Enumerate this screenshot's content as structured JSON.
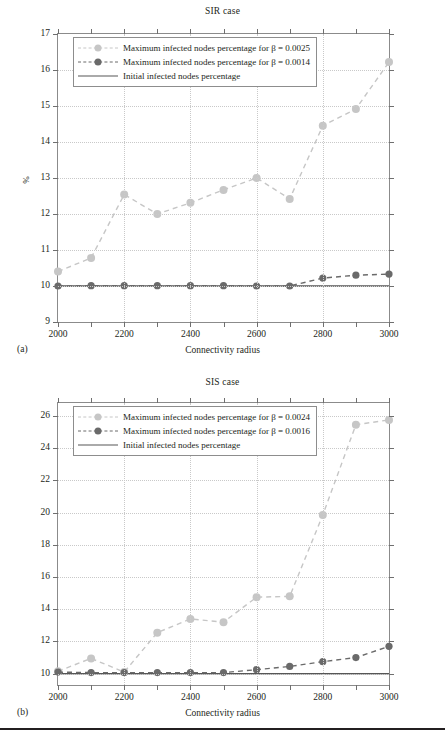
{
  "figure": {
    "panels": [
      {
        "caption": "(a)",
        "title": "SIR case",
        "xlabel": "Connectivity radius",
        "ylabel": "%"
      },
      {
        "caption": "(b)",
        "title": "SIS case",
        "xlabel": "Connectivity radius",
        "ylabel": "%"
      }
    ]
  },
  "colors": {
    "light_series": "#c6c6c6",
    "dark_series": "#6a6a6a",
    "baseline": "#565656",
    "frame": "#8b8b8b",
    "grid": "#c9c9c9",
    "text": "#231f20",
    "background": "#ffffff"
  },
  "chart_data": [
    {
      "type": "line",
      "title": "SIR case",
      "xlabel": "Connectivity radius",
      "ylabel": "%",
      "xlim": [
        2000,
        3000
      ],
      "ylim": [
        9,
        17
      ],
      "xticks": [
        2000,
        2100,
        2200,
        2300,
        2400,
        2500,
        2600,
        2700,
        2800,
        2900,
        3000
      ],
      "xticklabels": [
        "2000",
        "",
        "2200",
        "",
        "2400",
        "",
        "2600",
        "",
        "2800",
        "",
        "3000"
      ],
      "yticks": [
        9,
        10,
        11,
        12,
        13,
        14,
        15,
        16,
        17
      ],
      "yticklabels": [
        "9",
        "10",
        "11",
        "12",
        "13",
        "14",
        "15",
        "16",
        "17"
      ],
      "grid": true,
      "legend_position": "upper left",
      "x": [
        2000,
        2100,
        2200,
        2300,
        2400,
        2500,
        2600,
        2700,
        2800,
        2900,
        3000
      ],
      "series": [
        {
          "name": "Maximum infected nodes percentage for β = 0.0025",
          "style": "dashed-marker",
          "color": "#c6c6c6",
          "values": [
            10.4,
            10.78,
            12.54,
            12.0,
            12.31,
            12.67,
            13.0,
            12.42,
            14.45,
            14.92,
            16.22
          ]
        },
        {
          "name": "Maximum infected nodes percentage for β = 0.0014",
          "style": "dashed-marker",
          "color": "#6a6a6a",
          "values": [
            10.0,
            10.01,
            10.01,
            10.01,
            10.01,
            10.01,
            10.0,
            10.0,
            10.22,
            10.3,
            10.33
          ]
        },
        {
          "name": "Initial infected nodes percentage",
          "style": "solid",
          "color": "#565656",
          "values": [
            10.0,
            10.0,
            10.0,
            10.0,
            10.0,
            10.0,
            10.0,
            10.0,
            10.0,
            10.0,
            10.0
          ]
        }
      ]
    },
    {
      "type": "line",
      "title": "SIS case",
      "xlabel": "Connectivity radius",
      "ylabel": "%",
      "xlim": [
        2000,
        3000
      ],
      "ylim": [
        9.3,
        26.8
      ],
      "xticks": [
        2000,
        2100,
        2200,
        2300,
        2400,
        2500,
        2600,
        2700,
        2800,
        2900,
        3000
      ],
      "xticklabels": [
        "2000",
        "",
        "2200",
        "",
        "2400",
        "",
        "2600",
        "",
        "2800",
        "",
        "3000"
      ],
      "yticks": [
        10,
        12,
        14,
        16,
        18,
        20,
        22,
        24,
        26
      ],
      "yticklabels": [
        "10",
        "12",
        "14",
        "16",
        "18",
        "20",
        "22",
        "24",
        "26"
      ],
      "grid": true,
      "legend_position": "upper left",
      "x": [
        2000,
        2100,
        2200,
        2300,
        2400,
        2500,
        2600,
        2700,
        2800,
        2900,
        3000
      ],
      "series": [
        {
          "name": "Maximum infected nodes percentage for β = 0.0024",
          "style": "dashed-marker",
          "color": "#c6c6c6",
          "values": [
            10.15,
            10.95,
            10.1,
            12.55,
            13.4,
            13.2,
            14.75,
            14.8,
            19.85,
            25.45,
            25.75
          ]
        },
        {
          "name": "Maximum infected nodes percentage for β = 0.0016",
          "style": "dashed-marker",
          "color": "#6a6a6a",
          "values": [
            10.1,
            10.07,
            10.07,
            10.07,
            10.07,
            10.07,
            10.25,
            10.45,
            10.75,
            11.0,
            11.7
          ]
        },
        {
          "name": "Initial infected nodes percentage",
          "style": "solid",
          "color": "#565656",
          "values": [
            10.0,
            10.0,
            10.0,
            10.0,
            10.0,
            10.0,
            10.0,
            10.0,
            10.0,
            10.0,
            10.0
          ]
        }
      ]
    }
  ],
  "footer_rule": true
}
